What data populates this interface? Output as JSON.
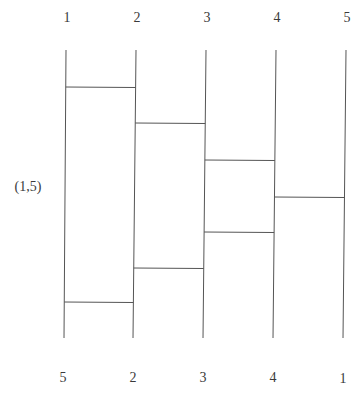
{
  "diagram": {
    "type": "ladder-diagram",
    "top_labels": [
      "1",
      "2",
      "3",
      "4",
      "5"
    ],
    "bottom_labels": [
      "5",
      "2",
      "3",
      "4",
      "1"
    ],
    "side_label": "(1,5)",
    "line_color": "#555555",
    "verticals": [
      {
        "x_top": 66,
        "x_bottom": 64
      },
      {
        "x_top": 136,
        "x_bottom": 133
      },
      {
        "x_top": 206,
        "x_bottom": 203
      },
      {
        "x_top": 276,
        "x_bottom": 273
      },
      {
        "x_top": 346,
        "x_bottom": 343
      }
    ],
    "y_top": 50,
    "y_bottom": 338,
    "rungs": [
      {
        "from": 1,
        "to": 2,
        "y": 87
      },
      {
        "from": 2,
        "to": 3,
        "y": 123
      },
      {
        "from": 3,
        "to": 4,
        "y": 160
      },
      {
        "from": 4,
        "to": 5,
        "y": 197
      },
      {
        "from": 3,
        "to": 4,
        "y": 232
      },
      {
        "from": 2,
        "to": 3,
        "y": 268
      },
      {
        "from": 1,
        "to": 2,
        "y": 302
      }
    ]
  }
}
